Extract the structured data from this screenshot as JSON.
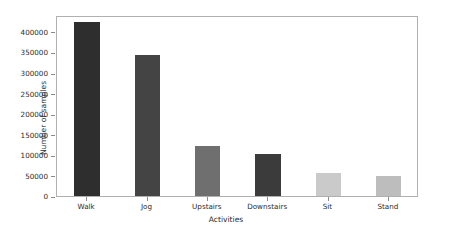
{
  "chart_data": {
    "type": "bar",
    "title": "",
    "xlabel": "Activities",
    "ylabel": "Number of samples",
    "categories": [
      "Walk",
      "Jog",
      "Upstairs",
      "Downstairs",
      "Sit",
      "Stand"
    ],
    "values": [
      424000,
      344000,
      121000,
      101000,
      57000,
      48000
    ],
    "colors": [
      "#2e2e2e",
      "#444444",
      "#6f6f6f",
      "#3b3b3b",
      "#cacaca",
      "#bdbdbd"
    ],
    "ylim": [
      0,
      440000
    ],
    "yticks": [
      0,
      50000,
      100000,
      150000,
      200000,
      250000,
      300000,
      350000,
      400000
    ],
    "ytick_labels": [
      "0",
      "50000",
      "100000",
      "150000",
      "200000",
      "250000",
      "300000",
      "350000",
      "400000"
    ],
    "grid": false,
    "legend": "none",
    "axis_color": "#b0b0b0",
    "background": "#ffffff"
  }
}
